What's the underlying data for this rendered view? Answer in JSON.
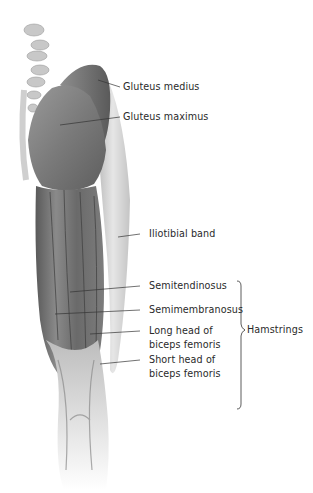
{
  "figure": {
    "labels": [
      {
        "id": "gluteus-medius",
        "text": "Gluteus medius"
      },
      {
        "id": "gluteus-maximus",
        "text": "Gluteus maximus"
      },
      {
        "id": "iliotibial-band",
        "text": "Iliotibial band"
      },
      {
        "id": "semitendinosus",
        "text": "Semitendinosus"
      },
      {
        "id": "semimembranosus",
        "text": "Semimembranosus"
      },
      {
        "id": "long-head-biceps-femoris",
        "text": "Long head of biceps femoris"
      },
      {
        "id": "short-head-biceps-femoris",
        "text": "Short head of biceps femoris"
      }
    ],
    "group": {
      "text": "Hamstrings"
    }
  },
  "colors": {
    "background": "#ffffff",
    "text": "#2a2a2a",
    "leader_line": "#333333",
    "muscle_dark": "#5a5a5a",
    "muscle_mid": "#8a8a8a",
    "band_light": "#d9d9d9"
  }
}
